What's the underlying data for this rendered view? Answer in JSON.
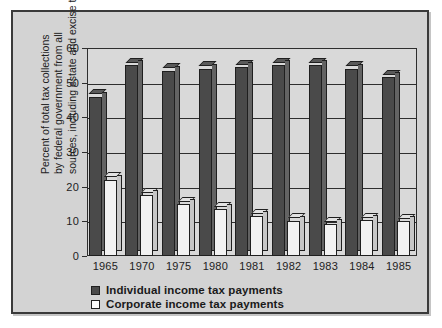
{
  "chart_data": {
    "type": "bar",
    "title": "",
    "subtitle": "",
    "xlabel": "",
    "ylabel": "Percent of total tax collections by federal government from all sources, including estate and excise taxes",
    "ylabel_lines": [
      "Percent of total tax collections",
      "by federal government from all",
      "sources, including estate and excise taxes"
    ],
    "categories": [
      "1965",
      "1970",
      "1975",
      "1980",
      "1981",
      "1982",
      "1983",
      "1984",
      "1985"
    ],
    "ylim": [
      0,
      60
    ],
    "yticks": [
      0,
      10,
      20,
      30,
      40,
      50,
      60
    ],
    "ytick_labels": [
      "0",
      "10",
      "20",
      "30",
      "40",
      "50",
      "60"
    ],
    "grid": true,
    "legend_position": "bottom-left",
    "series": [
      {
        "name": "Individual income tax payments",
        "key": "individual",
        "color": "#4a4a4a",
        "style": "filled",
        "values": [
          46,
          55,
          53.5,
          54,
          54.5,
          55,
          55,
          54,
          51.5
        ]
      },
      {
        "name": "Corporate income tax payments",
        "key": "corporate",
        "color": "#f2f2f2",
        "style": "hollow",
        "values": [
          22,
          17.5,
          15,
          13.5,
          11.5,
          10.2,
          9.2,
          10.3,
          10
        ]
      }
    ]
  },
  "legend": {
    "items": [
      {
        "label": "Individual income tax payments",
        "swatch": "filled-square-icon"
      },
      {
        "label": "Corporate income tax payments",
        "swatch": "hollow-square-icon"
      }
    ]
  }
}
